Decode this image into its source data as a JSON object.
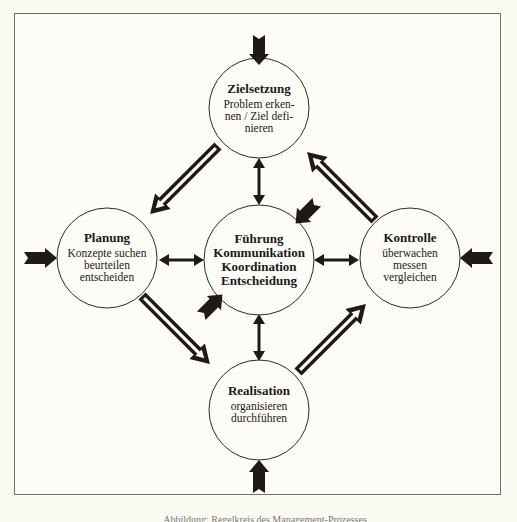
{
  "diagram": {
    "nodes": {
      "top": {
        "title": "Zielsetzung",
        "lines": [
          "Problem erken-",
          "nen / Ziel defi-",
          "nieren"
        ]
      },
      "left": {
        "title": "Planung",
        "lines": [
          "Konzepte suchen",
          "beurteilen",
          "entscheiden"
        ]
      },
      "center": {
        "lines": [
          "Führung",
          "Kommunikation",
          "Koordination",
          "Entscheidung"
        ]
      },
      "right": {
        "title": "Kontrolle",
        "lines": [
          "überwachen",
          "messen",
          "vergleichen"
        ]
      },
      "bottom": {
        "title": "Realisation",
        "lines": [
          "organisieren",
          "durchführen"
        ]
      }
    },
    "colors": {
      "ink": "#1f1a17",
      "frame": "#6e6e6e",
      "paper": "#fdfcf6"
    },
    "caption": "Abbildung: Regelkreis des Management-Prozesses"
  }
}
